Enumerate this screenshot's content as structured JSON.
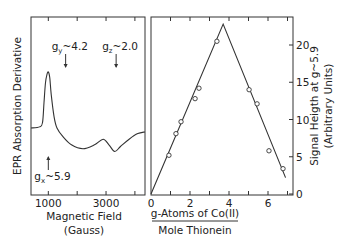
{
  "chart_data": [
    {
      "type": "line",
      "title": "",
      "xlabel": "Magnetic Field",
      "xlabel_unit": "(Gauss)",
      "ylabel": "EPR Absorption Derivative",
      "x_ticks_labeled": [
        "1000",
        "3000"
      ],
      "x_ticks": [
        1000,
        2000,
        3000,
        4000
      ],
      "xlim": [
        400,
        4350
      ],
      "grid": false,
      "annotations": [
        {
          "text_base": "g",
          "sub": "y",
          "text_rest": "~4.2",
          "arrow": "down",
          "x": 1600
        },
        {
          "text_base": "g",
          "sub": "z",
          "text_rest": "~2.0",
          "arrow": "down",
          "x": 3350
        },
        {
          "text_base": "g",
          "sub": "x",
          "text_rest": "~5.9",
          "arrow": "up",
          "x": 1000
        }
      ],
      "series": [
        {
          "name": "EPR spectrum",
          "x": [
            400,
            700,
            800,
            850,
            900,
            950,
            1000,
            1050,
            1100,
            1200,
            1300,
            1500,
            1800,
            2200,
            2600,
            2900,
            3100,
            3300,
            3500,
            3800,
            4100,
            4350
          ],
          "y_relative": [
            0.0,
            0.02,
            0.1,
            0.45,
            0.8,
            0.95,
            1.0,
            0.9,
            0.6,
            0.2,
            0.0,
            -0.15,
            -0.3,
            -0.37,
            -0.3,
            -0.2,
            -0.3,
            -0.42,
            -0.33,
            -0.2,
            -0.1,
            -0.07
          ]
        }
      ]
    },
    {
      "type": "scatter",
      "title": "",
      "xlabel_numerator": "g-Atoms of Co(II)",
      "xlabel_denominator": "Mole Thionein",
      "ylabel": "Signal Heigth at g~5.9",
      "ylabel_unit": "(Arbitrary Units)",
      "x_tick_labels": [
        "0",
        "2",
        "4",
        "6"
      ],
      "y_tick_labels": [
        "0",
        "5",
        "10",
        "15",
        "20"
      ],
      "xlim": [
        0,
        7.3
      ],
      "ylim": [
        0,
        24
      ],
      "grid": false,
      "series": [
        {
          "name": "measured",
          "marker": "open-circle",
          "x": [
            0.92,
            1.28,
            1.54,
            2.26,
            2.46,
            3.38,
            5.03,
            5.44,
            6.05,
            6.77
          ],
          "y": [
            5.2,
            8.1,
            9.7,
            12.8,
            14.2,
            20.5,
            14.0,
            12.1,
            5.8,
            3.4
          ]
        },
        {
          "name": "fit",
          "style": "line",
          "x": [
            0,
            3.7,
            6.9
          ],
          "y": [
            0,
            22.8,
            2.2
          ]
        }
      ]
    }
  ]
}
